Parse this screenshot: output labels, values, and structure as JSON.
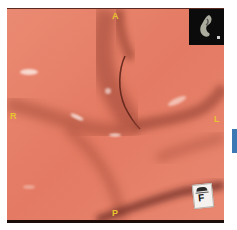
{
  "viewer": {
    "type": "virtual-endoscopy-3d-view",
    "orientation_labels": {
      "anterior": "A",
      "posterior": "P",
      "right": "R",
      "left": "L"
    },
    "orientation_cube": {
      "face_label": "F"
    },
    "locator_inset": {
      "icon": "organ-overview-thumbnail"
    },
    "colors": {
      "mucosa": "#e57d66",
      "fold_shadow": "#8a3a2c",
      "label": "#e8c430",
      "side_marker": "#3c78b4",
      "inset_bg": "#0b0b0b"
    }
  }
}
